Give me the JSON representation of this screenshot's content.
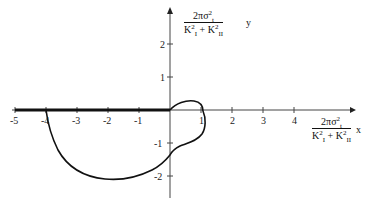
{
  "diagram": {
    "type": "parametric curve plot",
    "x_axis": {
      "ticks": [
        "-5",
        "-4",
        "-3",
        "-2",
        "-1",
        "1",
        "2",
        "3",
        "4"
      ],
      "label_num": "2πσ",
      "label_den": "K + K",
      "var": "x"
    },
    "y_axis": {
      "ticks": [
        "2",
        "1",
        "-1",
        "-2"
      ],
      "label_num": "2πσ",
      "label_den": "K + K",
      "var": "y"
    },
    "label_parts": {
      "sigma_sup": "2",
      "sigma_sub": "t",
      "k1_sup": "2",
      "k1_sub": "I",
      "k2_sup": "2",
      "k2_sub": "II"
    },
    "features": {
      "bold_segment": "Thick line along negative x-axis from -5 to 0",
      "curve": "Closed loop passing through (0,0), (1,0), (-4,0), bottom near (-2,-2)"
    },
    "colors": {
      "line": "#111111",
      "axis": "#444444",
      "background": "#ffffff"
    }
  }
}
